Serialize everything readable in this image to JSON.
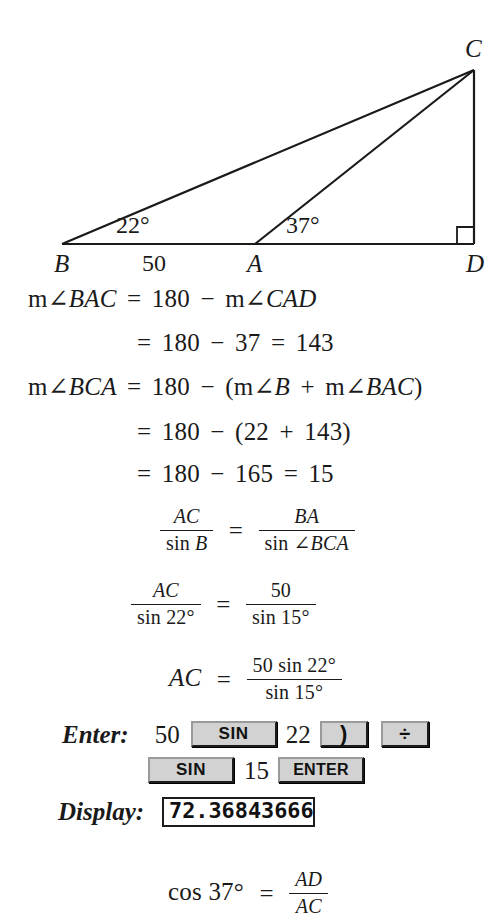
{
  "figure": {
    "points": [
      {
        "label": "B",
        "x": 62,
        "y": 244
      },
      {
        "label": "A",
        "x": 255,
        "y": 244
      },
      {
        "label": "D",
        "x": 474,
        "y": 244
      },
      {
        "label": "C",
        "x": 474,
        "y": 70
      }
    ],
    "angles": [
      {
        "label": "22°",
        "at": "B"
      },
      {
        "label": "37°",
        "at": "A"
      }
    ],
    "side_labels": [
      {
        "label": "50",
        "between": "B-A"
      }
    ],
    "right_angle_at": "D",
    "stroke_color": "#1a1a1a"
  },
  "steps": {
    "line1": {
      "lhs_m": "m",
      "lhs_angle": "∠",
      "lhs_var": "BAC",
      "eq": "=",
      "v1": "180",
      "minus": "−",
      "r_m": "m",
      "r_angle": "∠",
      "r_var": "CAD"
    },
    "line2": {
      "eq": "=",
      "v1": "180",
      "minus": "−",
      "v2": "37",
      "eq2": "=",
      "v3": "143"
    },
    "line3": {
      "lhs_m": "m",
      "lhs_angle": "∠",
      "lhs_var": "BCA",
      "eq": "=",
      "v1": "180",
      "minus": "−",
      "open": "(",
      "m1": "m",
      "a1": "∠",
      "var1": "B",
      "plus": "+",
      "m2": "m",
      "a2": "∠",
      "var2": "BAC",
      "close": ")"
    },
    "line4": {
      "eq": "=",
      "v1": "180",
      "minus": "−",
      "open": "(",
      "v2": "22",
      "plus": "+",
      "v3": "143",
      "close": ")"
    },
    "line5": {
      "eq": "=",
      "v1": "180",
      "minus": "−",
      "v2": "165",
      "eq2": "=",
      "v3": "15"
    }
  },
  "proportion1": {
    "left_num": "AC",
    "left_den_sin": "sin",
    "left_den_var": "B",
    "eq": "=",
    "right_num": "BA",
    "right_den_sin": "sin",
    "right_den_angle": "∠",
    "right_den_var": "BCA"
  },
  "proportion2": {
    "left_num": "AC",
    "left_den": "sin 22°",
    "eq": "=",
    "right_num": "50",
    "right_den": "sin 15°"
  },
  "solved": {
    "lhs": "AC",
    "eq": "=",
    "num": "50 sin 22°",
    "den": "sin 15°"
  },
  "calculator": {
    "enter_label": "Enter:",
    "display_label": "Display:",
    "row1": [
      {
        "kind": "num",
        "text": "50"
      },
      {
        "kind": "key",
        "text": "SIN",
        "style": "key-sin"
      },
      {
        "kind": "num",
        "text": "22"
      },
      {
        "kind": "key",
        "text": ")",
        "style": "key-paren"
      },
      {
        "kind": "key",
        "text": "÷",
        "style": "key-div"
      }
    ],
    "row2": [
      {
        "kind": "key",
        "text": "SIN",
        "style": "key-sin"
      },
      {
        "kind": "num",
        "text": "15"
      },
      {
        "kind": "key",
        "text": "ENTER",
        "style": "key-enter"
      }
    ],
    "display_value": "72.36843666"
  },
  "final": {
    "cos": "cos 37°",
    "eq": "=",
    "num": "AD",
    "den": "AC"
  }
}
